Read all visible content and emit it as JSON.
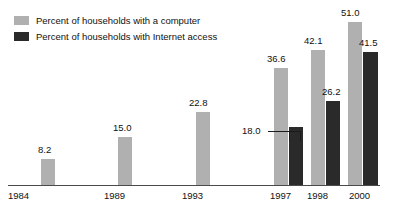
{
  "legend": {
    "items": [
      {
        "label": "Percent of households with a computer",
        "color": "#b0b0b0",
        "swatch_name": "legend-swatch-computer"
      },
      {
        "label": "Percent of households with Internet access",
        "color": "#2a2a2a",
        "swatch_name": "legend-swatch-internet"
      }
    ]
  },
  "axis": {
    "tick_labels": [
      "1984",
      "1989",
      "1993",
      "1997",
      "1998",
      "2000"
    ]
  },
  "labels": {
    "computer": [
      "8.2",
      "15.0",
      "22.8",
      "36.6",
      "42.1",
      "51.0"
    ],
    "internet": [
      "18.0",
      "26.2",
      "41.5"
    ]
  },
  "chart_data": {
    "type": "bar",
    "title": "",
    "subtitle": "",
    "xlabel": "",
    "ylabel": "",
    "categories": [
      "1984",
      "1989",
      "1993",
      "1997",
      "1998",
      "2000"
    ],
    "series": [
      {
        "name": "Percent of households with a computer",
        "color": "#b0b0b0",
        "values": [
          8.2,
          15.0,
          22.8,
          36.6,
          42.1,
          51.0
        ]
      },
      {
        "name": "Percent of households with Internet access",
        "color": "#2a2a2a",
        "values": [
          null,
          null,
          null,
          18.0,
          26.2,
          41.5
        ]
      }
    ],
    "ylim": [
      0,
      51.0
    ],
    "grid": false,
    "y_axis_visible": false,
    "legend_position": "top-left",
    "annotations": [
      {
        "text": "18.0",
        "target": "1997 Internet access bar",
        "style": "leader-line-with-bracket"
      }
    ]
  }
}
